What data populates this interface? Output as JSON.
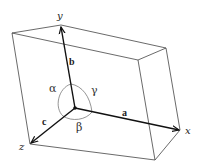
{
  "diagram": {
    "axes": {
      "x_label": "x",
      "y_label": "y",
      "z_label": "z"
    },
    "vectors": {
      "a": "a",
      "b": "b",
      "c": "c"
    },
    "angles": {
      "alpha": "α",
      "beta": "β",
      "gamma": "γ"
    },
    "colors": {
      "line": "#333333",
      "vector": "#111111",
      "background": "#ffffff"
    }
  }
}
